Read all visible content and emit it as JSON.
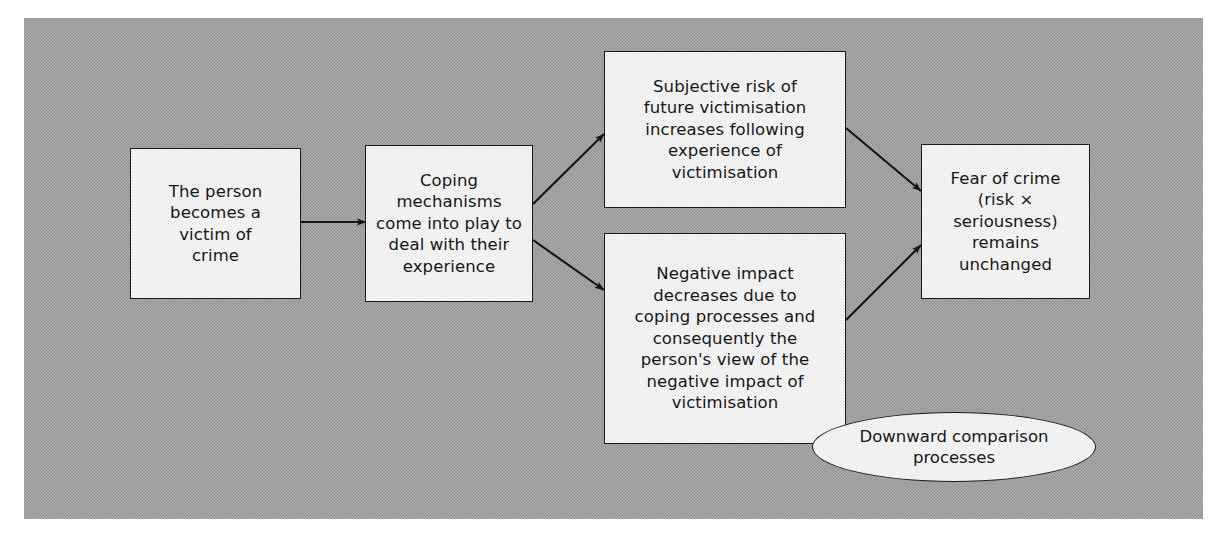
{
  "figure": {
    "background_color": "#9b9b9b",
    "node_fill_color": "#ececeb",
    "stroke_color": "#1a1a1a"
  },
  "nodes": [
    {
      "id": "victim",
      "shape": "rect",
      "text": "The person\nbecomes a\nvictim of\ncrime"
    },
    {
      "id": "coping",
      "shape": "rect",
      "text": "Coping\nmechanisms\ncome into play to\ndeal with their\nexperience"
    },
    {
      "id": "subjective-risk",
      "shape": "rect",
      "text": "Subjective risk of\nfuture victimisation\nincreases following\nexperience of\nvictimisation"
    },
    {
      "id": "negative-impact",
      "shape": "rect",
      "text": "Negative impact\ndecreases due to\ncoping processes and\nconsequently the\nperson's view of the\nnegative impact of\nvictimisation"
    },
    {
      "id": "fear-of-crime",
      "shape": "rect",
      "text": "Fear of crime\n(risk ×\nseriousness)\nremains\nunchanged"
    },
    {
      "id": "downward-comparison",
      "shape": "ellipse",
      "text": "Downward comparison\nprocesses"
    }
  ],
  "edges": [
    {
      "id": "victim-to-coping",
      "from": "victim",
      "to": "coping",
      "arrow": true
    },
    {
      "id": "coping-to-subjective-risk",
      "from": "coping",
      "to": "subjective-risk",
      "arrow": true
    },
    {
      "id": "coping-to-negative-impact",
      "from": "coping",
      "to": "negative-impact",
      "arrow": true
    },
    {
      "id": "subjective-risk-to-fear",
      "from": "subjective-risk",
      "to": "fear-of-crime",
      "arrow": true
    },
    {
      "id": "negative-impact-to-fear",
      "from": "negative-impact",
      "to": "fear-of-crime",
      "arrow": true
    }
  ]
}
